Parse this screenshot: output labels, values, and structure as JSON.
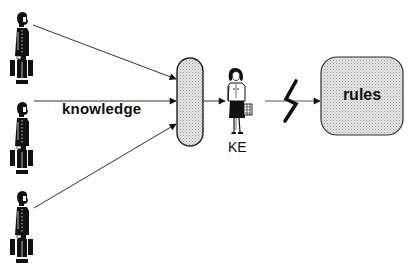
{
  "diagram": {
    "experts": [
      {
        "id": "expert-1",
        "label": ""
      },
      {
        "id": "expert-2",
        "label": ""
      },
      {
        "id": "expert-3",
        "label": ""
      }
    ],
    "edge_label": "knowledge",
    "collector_label": "",
    "engineer_label": "KE",
    "target_label": "rules",
    "colors": {
      "stroke": "#222222",
      "fill_dotted": "#d8d8d8",
      "arrow_line": "#444444"
    },
    "edges": [
      {
        "from": "expert-1",
        "to": "collector"
      },
      {
        "from": "expert-2",
        "to": "collector",
        "label": "knowledge"
      },
      {
        "from": "expert-3",
        "to": "collector"
      },
      {
        "from": "collector",
        "to": "engineer"
      },
      {
        "from": "engineer",
        "to": "rules",
        "style": "broken / zigzag"
      }
    ]
  }
}
